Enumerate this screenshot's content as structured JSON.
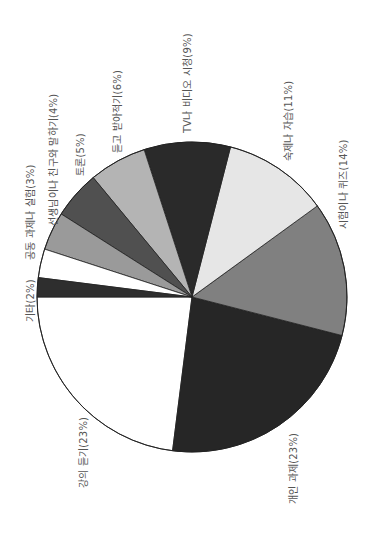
{
  "chart_data": {
    "type": "pie",
    "title": "",
    "orientation": "rotated 90° counterclockwise",
    "categories": [
      "강의 듣기",
      "개인 과제",
      "시험이나 퀴즈",
      "숙제나 자습",
      "TV나 비디오 시청",
      "듣고 받아적기",
      "토론",
      "선생님이나 친구와 말하기",
      "공동 과제나 실험",
      "기타"
    ],
    "values": [
      23,
      23,
      14,
      11,
      9,
      6,
      5,
      4,
      3,
      2
    ],
    "unit": "%",
    "colors": [
      "#ffffff",
      "#262626",
      "#808080",
      "#e6e6e6",
      "#2a2a2a",
      "#b4b4b4",
      "#505050",
      "#9a9a9a",
      "#ffffff",
      "#2e2e2e"
    ],
    "start_angle_deg": 180,
    "direction": "counterclockwise (screen)"
  },
  "labels": [
    {
      "text": "강의 듣기(23%)",
      "x": 75,
      "y": 488
    },
    {
      "text": "개인 과제(23%)",
      "x": 285,
      "y": 504
    },
    {
      "text": "시험이나 퀴즈(14%)",
      "x": 335,
      "y": 229
    },
    {
      "text": "숙제나 자습(11%)",
      "x": 280,
      "y": 161
    },
    {
      "text": "TV나 비디오 시청(9%)",
      "x": 179,
      "y": 133
    },
    {
      "text": "듣고 받아적기(6%)",
      "x": 109,
      "y": 153
    },
    {
      "text": "토론(5%)",
      "x": 72,
      "y": 176
    },
    {
      "text": "선생님이나 친구와 말하기(4%)",
      "x": 45,
      "y": 226
    },
    {
      "text": "공동 과제나 실험(3%)",
      "x": 22,
      "y": 260
    },
    {
      "text": "기타(2%)",
      "x": 22,
      "y": 322
    }
  ]
}
